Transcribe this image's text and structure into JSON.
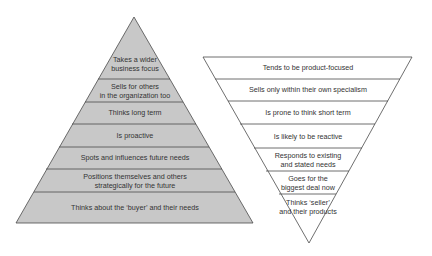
{
  "left_pyramid": {
    "fill": "#c8c8c8",
    "stroke": "#4a4a4a",
    "bands": [
      {
        "label": "Takes a wider\nbusiness focus"
      },
      {
        "label": "Sells for others\nin the organization too"
      },
      {
        "label": "Thinks long term"
      },
      {
        "label": "Is proactive"
      },
      {
        "label": "Spots and influences future needs"
      },
      {
        "label": "Positions themselves and others\nstrategically for the future"
      },
      {
        "label": "Thinks about the ‘buyer’ and their needs"
      }
    ]
  },
  "right_pyramid": {
    "fill": "#ffffff",
    "stroke": "#4a4a4a",
    "bands": [
      {
        "label": "Tends to be product-focused"
      },
      {
        "label": "Sells only within their own specialism"
      },
      {
        "label": "Is prone to think short term"
      },
      {
        "label": "Is likely to be reactive"
      },
      {
        "label": "Responds to existing\nand stated needs"
      },
      {
        "label": "Goes for the\nbiggest deal now"
      },
      {
        "label": "Thinks ‘seller’\nand their products"
      }
    ]
  }
}
